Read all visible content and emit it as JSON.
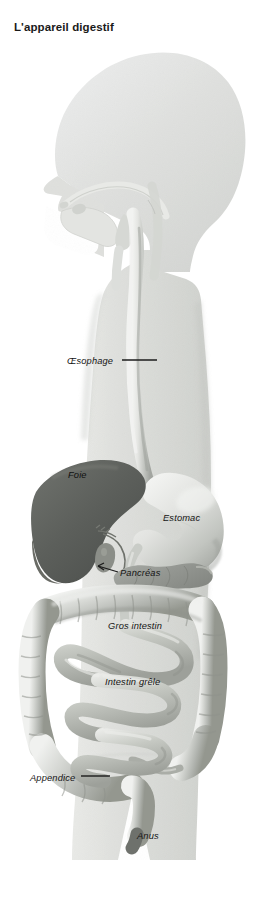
{
  "figure": {
    "title": "L'appareil digestif",
    "language": "fr",
    "view": "left lateral / sagittal silhouette of a human body facing left"
  },
  "labels": [
    {
      "id": "oesophage",
      "text": "Œsophage",
      "leader": "line",
      "x": 67,
      "y": 363
    },
    {
      "id": "foie",
      "text": "Foie",
      "leader": "none",
      "x": 68,
      "y": 477
    },
    {
      "id": "estomac",
      "text": "Estomac",
      "leader": "none",
      "x": 163,
      "y": 520
    },
    {
      "id": "pancreas",
      "text": "Pancréas",
      "leader": "arrow",
      "x": 120,
      "y": 575
    },
    {
      "id": "gros-intestin",
      "text": "Gros intestin",
      "leader": "none",
      "x": 108,
      "y": 628
    },
    {
      "id": "intestin-grele",
      "text": "Intestin grêle",
      "leader": "none",
      "x": 105,
      "y": 684
    },
    {
      "id": "appendice",
      "text": "Appendice",
      "leader": "line",
      "x": 30,
      "y": 780
    },
    {
      "id": "anus",
      "text": "Anus",
      "leader": "none",
      "x": 137,
      "y": 838
    }
  ],
  "colors": {
    "background": "#ffffff",
    "body_silhouette": "#d9dbd8",
    "body_silhouette_light": "#e7e8e5",
    "organ_light": "#d2d4d0",
    "organ_mid": "#b0b3ae",
    "organ_dark": "#7e817c",
    "liver_dark": "#5b5e5a",
    "liver_darkest": "#4a4d49",
    "label_text": "#151515",
    "leader_line": "#1b1b1b",
    "title_text": "#1a1a1a"
  }
}
